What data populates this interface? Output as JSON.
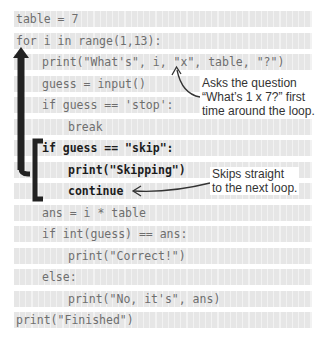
{
  "code": {
    "lines": [
      {
        "text": "table = 7",
        "indent": 0,
        "highlight": false
      },
      {
        "text": "for i in range(1,13):",
        "indent": 0,
        "highlight": false
      },
      {
        "text": "print(\"What's\", i, \"x\", table, \"?\")",
        "indent": 1,
        "highlight": false
      },
      {
        "text": "guess = input()",
        "indent": 1,
        "highlight": false
      },
      {
        "text": "if guess == 'stop':",
        "indent": 1,
        "highlight": false
      },
      {
        "text": "break",
        "indent": 2,
        "highlight": false
      },
      {
        "text": "if guess == \"skip\":",
        "indent": 1,
        "highlight": true
      },
      {
        "text": "print(\"Skipping\")",
        "indent": 2,
        "highlight": true
      },
      {
        "text": "continue",
        "indent": 2,
        "highlight": true
      },
      {
        "text": "ans = i * table",
        "indent": 1,
        "highlight": false
      },
      {
        "text": "if int(guess) == ans:",
        "indent": 1,
        "highlight": false
      },
      {
        "text": "print(\"Correct!\")",
        "indent": 2,
        "highlight": false
      },
      {
        "text": "else:",
        "indent": 1,
        "highlight": false
      },
      {
        "text": "print(\"No, it's\", ans)",
        "indent": 2,
        "highlight": false
      },
      {
        "text": "print(\"Finished\")",
        "indent": 0,
        "highlight": false
      }
    ]
  },
  "annotations": {
    "question": {
      "line1": "Asks the question",
      "line2": "“What’s 1 x 7?” first",
      "line3": "time around the loop."
    },
    "skip": {
      "line1": "Skips straight",
      "line2": "to the next loop."
    }
  },
  "colors": {
    "code_text": "#6e6e6e",
    "highlight_text": "#1c1c1c",
    "arrow": "#222222",
    "stripe": "#e6e6e6"
  },
  "icons": {
    "loop_arrow": "loop-back-arrow-icon",
    "bracket": "block-bracket-icon"
  }
}
